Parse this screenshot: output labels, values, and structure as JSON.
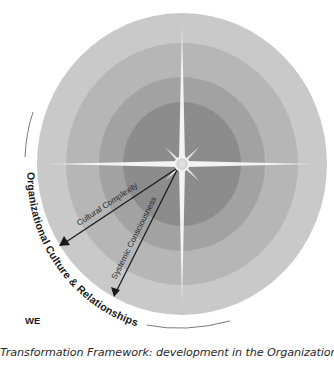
{
  "diagram": {
    "center": {
      "x": 182,
      "y": 164
    },
    "rings": [
      {
        "name": "outer",
        "rx": 145,
        "ry": 151,
        "color": "#c9c9c9"
      },
      {
        "name": "ring-3",
        "rx": 116,
        "ry": 121,
        "color": "#b6b6b6"
      },
      {
        "name": "ring-2",
        "rx": 83,
        "ry": 87,
        "color": "#a2a2a2"
      },
      {
        "name": "inner",
        "rx": 59,
        "ry": 62,
        "color": "#8c8c8c"
      }
    ],
    "arrows": [
      {
        "label": "Cultural Complexity",
        "from": [
          176,
          169
        ],
        "to": [
          60,
          246
        ]
      },
      {
        "label": "Systemic Consciousness",
        "from": [
          177,
          170
        ],
        "to": [
          114,
          297
        ]
      }
    ],
    "arc_label": "Organizational Culture & Relationships",
    "quadrant_label": "WE",
    "colors": {
      "star": "#f4f4f4",
      "arrow": "#1a1a1a",
      "arc": "#7a7a7a",
      "text": "#1a1a1a"
    }
  },
  "caption": "Transformation Framework: development in the Organizational Culture"
}
